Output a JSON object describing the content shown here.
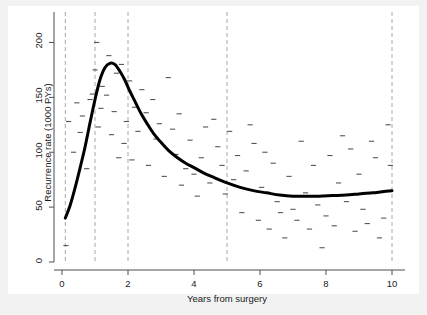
{
  "chart_data": {
    "type": "line",
    "title": "",
    "xlabel": "Years from surgery",
    "ylabel": "Recurrence rate (1000 PYs)",
    "xlim": [
      0,
      10
    ],
    "ylim": [
      0,
      215
    ],
    "xticks": [
      0,
      2,
      4,
      6,
      8,
      10
    ],
    "xtick_labels": [
      "0",
      "2",
      "4",
      "6",
      "8",
      "10"
    ],
    "yticks": [
      0,
      50,
      100,
      150,
      200
    ],
    "ytick_labels": [
      "0",
      "50",
      "100",
      "150",
      "200"
    ],
    "grid": false,
    "legend": "none",
    "knot_lines": {
      "label": "spline knots",
      "style": "dashed",
      "color": "#a8a8a8",
      "x_positions": [
        0.1,
        1.0,
        2.0,
        5.0,
        10.0
      ]
    },
    "series": [
      {
        "name": "Fitted recurrence rate (restricted cubic spline)",
        "style": "solid",
        "color": "#000000",
        "width": 3,
        "x": [
          0.1,
          0.25,
          0.4,
          0.55,
          0.7,
          0.85,
          1.0,
          1.15,
          1.3,
          1.45,
          1.6,
          1.75,
          1.9,
          2.05,
          2.2,
          2.4,
          2.6,
          2.8,
          3.0,
          3.25,
          3.5,
          3.75,
          4.0,
          4.3,
          4.6,
          5.0,
          5.4,
          5.8,
          6.2,
          6.6,
          7.0,
          7.4,
          7.8,
          8.2,
          8.6,
          9.0,
          9.4,
          9.7,
          10.0
        ],
        "y": [
          40,
          52,
          68,
          86,
          105,
          127,
          148,
          166,
          177,
          181,
          180,
          174,
          166,
          156,
          147,
          135,
          125,
          116,
          109,
          101,
          95,
          90,
          86,
          81,
          77,
          72,
          68,
          65,
          63,
          61,
          60,
          60,
          60,
          60.5,
          61,
          62,
          63,
          64,
          65
        ]
      },
      {
        "name": "Observed rates (individual interval estimates)",
        "style": "dash-markers",
        "color": "#555555",
        "points": [
          [
            0.12,
            15
          ],
          [
            0.2,
            128
          ],
          [
            0.35,
            100
          ],
          [
            0.45,
            145
          ],
          [
            0.55,
            118
          ],
          [
            0.62,
            133
          ],
          [
            0.75,
            85
          ],
          [
            0.85,
            148
          ],
          [
            0.92,
            153
          ],
          [
            1.0,
            175
          ],
          [
            1.05,
            200
          ],
          [
            1.1,
            123
          ],
          [
            1.18,
            140
          ],
          [
            1.22,
            160
          ],
          [
            1.35,
            152
          ],
          [
            1.42,
            188
          ],
          [
            1.5,
            116
          ],
          [
            1.58,
            137
          ],
          [
            1.65,
            172
          ],
          [
            1.72,
            95
          ],
          [
            1.8,
            180
          ],
          [
            1.88,
            108
          ],
          [
            1.95,
            128
          ],
          [
            2.05,
            165
          ],
          [
            2.12,
            93
          ],
          [
            2.2,
            141
          ],
          [
            2.3,
            119
          ],
          [
            2.42,
            157
          ],
          [
            2.55,
            136
          ],
          [
            2.62,
            88
          ],
          [
            2.75,
            148
          ],
          [
            2.85,
            112
          ],
          [
            2.95,
            126
          ],
          [
            3.1,
            78
          ],
          [
            3.22,
            168
          ],
          [
            3.35,
            121
          ],
          [
            3.45,
            98
          ],
          [
            3.55,
            135
          ],
          [
            3.62,
            70
          ],
          [
            3.75,
            85
          ],
          [
            3.88,
            111
          ],
          [
            4.0,
            80
          ],
          [
            4.1,
            60
          ],
          [
            4.22,
            95
          ],
          [
            4.35,
            123
          ],
          [
            4.48,
            72
          ],
          [
            4.6,
            130
          ],
          [
            4.72,
            105
          ],
          [
            4.85,
            88
          ],
          [
            4.95,
            62
          ],
          [
            5.08,
            119
          ],
          [
            5.2,
            75
          ],
          [
            5.32,
            97
          ],
          [
            5.45,
            45
          ],
          [
            5.58,
            83
          ],
          [
            5.7,
            125
          ],
          [
            5.82,
            108
          ],
          [
            5.95,
            38
          ],
          [
            6.05,
            68
          ],
          [
            6.15,
            100
          ],
          [
            6.28,
            30
          ],
          [
            6.4,
            90
          ],
          [
            6.52,
            55
          ],
          [
            6.62,
            45
          ],
          [
            6.75,
            22
          ],
          [
            6.88,
            78
          ],
          [
            7.0,
            48
          ],
          [
            7.12,
            38
          ],
          [
            7.25,
            110
          ],
          [
            7.38,
            63
          ],
          [
            7.5,
            30
          ],
          [
            7.62,
            88
          ],
          [
            7.75,
            52
          ],
          [
            7.88,
            13
          ],
          [
            8.0,
            42
          ],
          [
            8.12,
            97
          ],
          [
            8.25,
            33
          ],
          [
            8.38,
            72
          ],
          [
            8.5,
            115
          ],
          [
            8.62,
            55
          ],
          [
            8.75,
            103
          ],
          [
            8.88,
            28
          ],
          [
            9.0,
            80
          ],
          [
            9.12,
            48
          ],
          [
            9.25,
            35
          ],
          [
            9.38,
            110
          ],
          [
            9.5,
            95
          ],
          [
            9.62,
            22
          ],
          [
            9.75,
            40
          ],
          [
            9.88,
            125
          ],
          [
            9.95,
            88
          ]
        ]
      }
    ]
  },
  "axes": {
    "x_axis_name": "Years from surgery",
    "y_axis_name": "Recurrence rate (1000 PYs)"
  }
}
